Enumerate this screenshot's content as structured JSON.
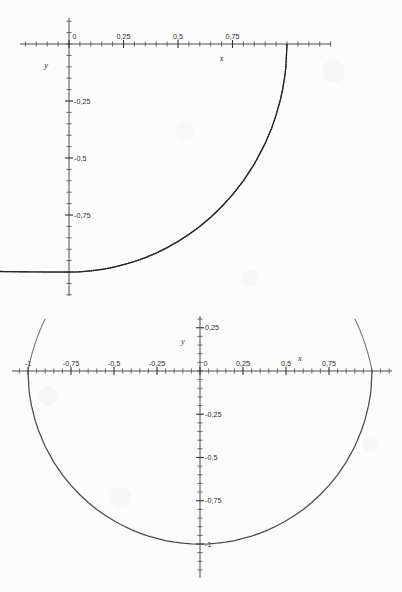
{
  "document": {
    "background_color": "#fcfcfc",
    "ink_color": "#3b3b3b",
    "curve_color": "#4b4b4b"
  },
  "chart_data": [
    {
      "id": "top",
      "type": "line",
      "title": "",
      "subtitle": "",
      "xlabel": "x",
      "ylabel": "y",
      "grid": false,
      "legend": "none",
      "xlim": [
        -0.9,
        4.8
      ],
      "ylim": [
        -1.12,
        0.12
      ],
      "xticks_major": [
        0,
        0.25,
        0.5,
        0.75
      ],
      "xtick_labels": [
        "0",
        "0,25",
        "0,5",
        "0,75"
      ],
      "yticks_major": [
        -0.25,
        -0.5,
        -0.75
      ],
      "ytick_labels": [
        "-0,25",
        "-0,5",
        "-0,75"
      ],
      "minor_tick_step": 0.05,
      "description": "quarter circle arc, fourth quadrant",
      "equation": "x^2 + y^2 = 1",
      "curve_domain": [
        -0.9,
        1.0
      ],
      "series": [
        {
          "name": "arc",
          "style": "dotted-overlay",
          "x": [
            -0.9,
            -0.8,
            -0.7,
            -0.6,
            -0.5,
            -0.4,
            -0.3,
            -0.2,
            -0.1,
            0.0,
            0.05,
            0.1,
            0.15,
            0.2,
            0.25,
            0.3,
            0.35,
            0.4,
            0.45,
            0.5,
            0.55,
            0.6,
            0.65,
            0.7,
            0.75,
            0.8,
            0.85,
            0.9,
            0.93,
            0.95,
            0.97,
            0.98,
            0.99,
            0.995,
            1.0
          ],
          "y": [
            -0.975,
            -0.98,
            -0.985,
            -0.99,
            -0.993,
            -0.996,
            -0.998,
            -0.999,
            -1.0,
            -1.0,
            -0.999,
            -0.995,
            -0.989,
            -0.98,
            -0.968,
            -0.954,
            -0.937,
            -0.917,
            -0.893,
            -0.866,
            -0.835,
            -0.8,
            -0.76,
            -0.714,
            -0.661,
            -0.6,
            -0.527,
            -0.436,
            -0.368,
            -0.312,
            -0.243,
            -0.199,
            -0.141,
            -0.1,
            0.0
          ]
        }
      ]
    },
    {
      "id": "bottom",
      "type": "line",
      "title": "",
      "subtitle": "",
      "xlabel": "x",
      "ylabel": "y",
      "grid": false,
      "legend": "none",
      "xlim": [
        -1.18,
        1.18
      ],
      "ylim": [
        -1.18,
        0.37
      ],
      "xticks_major": [
        -1,
        -0.75,
        -0.5,
        -0.25,
        0,
        0.25,
        0.5,
        0.75
      ],
      "xtick_labels": [
        "-1",
        "-0,75",
        "-0,5",
        "-0,25",
        "0",
        "0,25",
        "0,5",
        "0,75"
      ],
      "yticks_major": [
        0.25,
        -0.25,
        -0.5,
        -0.75,
        -1
      ],
      "ytick_labels": [
        "0,25",
        "-0,25",
        "-0,5",
        "-0,75",
        "-1"
      ],
      "minor_tick_step": 0.05,
      "description": "lower semicircle from x = -1 to x = 1",
      "equation": "y = -sqrt(1 - x^2)",
      "curve_domain": [
        -1.0,
        1.0
      ],
      "series": [
        {
          "name": "semicircle",
          "style": "solid",
          "x": [
            -1.0,
            -0.995,
            -0.99,
            -0.98,
            -0.96,
            -0.94,
            -0.9,
            -0.85,
            -0.8,
            -0.75,
            -0.7,
            -0.65,
            -0.6,
            -0.55,
            -0.5,
            -0.45,
            -0.4,
            -0.35,
            -0.3,
            -0.25,
            -0.2,
            -0.15,
            -0.1,
            -0.05,
            0.0,
            0.05,
            0.1,
            0.15,
            0.2,
            0.25,
            0.3,
            0.35,
            0.4,
            0.45,
            0.5,
            0.55,
            0.6,
            0.65,
            0.7,
            0.75,
            0.8,
            0.85,
            0.9,
            0.94,
            0.96,
            0.98,
            0.99,
            0.995,
            1.0
          ],
          "y": [
            0.0,
            -0.1,
            -0.141,
            -0.199,
            -0.28,
            -0.341,
            -0.436,
            -0.527,
            -0.6,
            -0.661,
            -0.714,
            -0.76,
            -0.8,
            -0.835,
            -0.866,
            -0.893,
            -0.917,
            -0.937,
            -0.954,
            -0.968,
            -0.98,
            -0.989,
            -0.995,
            -0.999,
            -1.0,
            -0.999,
            -0.995,
            -0.989,
            -0.98,
            -0.968,
            -0.954,
            -0.937,
            -0.917,
            -0.893,
            -0.866,
            -0.835,
            -0.8,
            -0.76,
            -0.714,
            -0.661,
            -0.6,
            -0.527,
            -0.436,
            -0.341,
            -0.28,
            -0.199,
            -0.141,
            -0.1,
            0.0
          ]
        }
      ],
      "curve_top_extension": {
        "note": "arc continues above the x-axis at both ends",
        "left_x": -1.0,
        "right_x": 1.0,
        "top_y": 0.3
      }
    }
  ]
}
